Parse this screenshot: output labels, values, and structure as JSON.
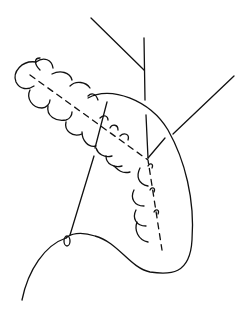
{
  "figure": {
    "stroke_color": "#111111",
    "background": "#ffffff",
    "loop_count": 9
  }
}
